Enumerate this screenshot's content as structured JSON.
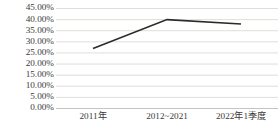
{
  "chart_data": {
    "type": "line",
    "title": "",
    "subtitle": "",
    "xlabel": "",
    "ylabel": "",
    "categories": [
      "2011年",
      "2012~2021",
      "2022年1季度"
    ],
    "values": [
      27,
      40,
      38
    ],
    "series": [
      {
        "name": "",
        "values": [
          27,
          40,
          38
        ]
      }
    ],
    "ylim": [
      0,
      45
    ],
    "ytick_labels": [
      "45.00%",
      "40.00%",
      "35.00%",
      "30.00%",
      "25.00%",
      "20.00%",
      "15.00%",
      "10.00%",
      "5.00%",
      "0.00%"
    ],
    "ytick_values": [
      45,
      40,
      35,
      30,
      25,
      20,
      15,
      10,
      5,
      0
    ],
    "grid": true,
    "grid_axis": "y",
    "legend": false,
    "legend_position": "none",
    "markers": false,
    "annotations": [],
    "colors": {
      "line": "#2b2b2b",
      "grid": "#d4d0c8",
      "axis": "#bdbdbd",
      "text": "#3a3a3a",
      "background": "#ffffff"
    }
  }
}
